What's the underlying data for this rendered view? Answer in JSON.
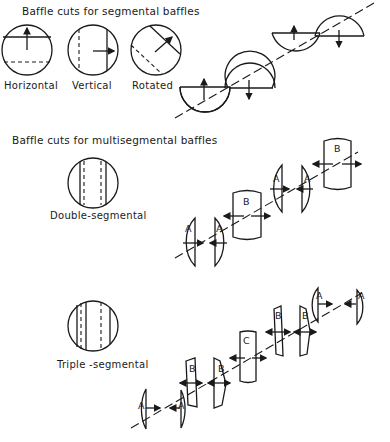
{
  "sections": {
    "segmental": {
      "title": "Baffle cuts for segmental baffles",
      "captions": [
        "Horizontal",
        "Vertical",
        "Rotated"
      ]
    },
    "multisegmental": {
      "title": "Baffle cuts for multisegmental baffles",
      "double": {
        "caption": "Double-segmental",
        "labels": [
          "A",
          "A",
          "B",
          "A",
          "A",
          "B"
        ]
      },
      "triple": {
        "caption": "Triple -segmental",
        "labels": [
          "A",
          "A",
          "B",
          "B",
          "C",
          "B",
          "B",
          "A",
          "A"
        ]
      }
    }
  },
  "icons": [
    "flow-arrow-icon",
    "baffle-circle-icon"
  ],
  "colors": {
    "ink": "#1a1a1a",
    "background": "#ffffff"
  }
}
